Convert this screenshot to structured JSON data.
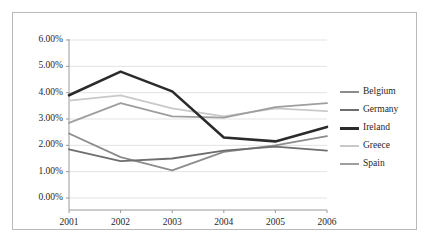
{
  "chart_data": {
    "type": "line",
    "title": "",
    "subtitle": "",
    "xlabel": "",
    "ylabel": "",
    "categories": [
      "2001",
      "2002",
      "2003",
      "2004",
      "2005",
      "2006"
    ],
    "ytick_labels": [
      "6.00%",
      "5.00%",
      "4.00%",
      "3.00%",
      "2.00%",
      "1.00%",
      "0.00%"
    ],
    "ytick_values": [
      6.0,
      5.0,
      4.0,
      3.0,
      2.0,
      1.0,
      0.0
    ],
    "ylim": [
      0.0,
      6.0
    ],
    "value_suffix": "%",
    "grid": "horizontal",
    "legend_position": "right",
    "series": [
      {
        "name": "Belgium",
        "color": "#8c8c8c",
        "width": 1.8,
        "values": [
          2.45,
          1.55,
          1.05,
          1.75,
          2.0,
          2.35
        ]
      },
      {
        "name": "Germany",
        "color": "#6e6e6e",
        "width": 1.8,
        "values": [
          1.85,
          1.4,
          1.5,
          1.8,
          1.95,
          1.8
        ]
      },
      {
        "name": "Ireland",
        "color": "#2b2b2b",
        "width": 2.6,
        "values": [
          3.9,
          4.8,
          4.05,
          2.3,
          2.15,
          2.7
        ]
      },
      {
        "name": "Greece",
        "color": "#c9c9c9",
        "width": 1.8,
        "values": [
          3.7,
          3.9,
          3.4,
          3.1,
          3.4,
          3.3
        ]
      },
      {
        "name": "Spain",
        "color": "#9e9e9e",
        "width": 1.8,
        "values": [
          2.85,
          3.6,
          3.1,
          3.05,
          3.45,
          3.6
        ]
      }
    ]
  },
  "style": {
    "grid_color": "#e3e3e3",
    "axis_color": "#9a9a9a",
    "border_color": "#b9b9b9",
    "text_color": "#1f1f1f",
    "background": "#ffffff"
  }
}
